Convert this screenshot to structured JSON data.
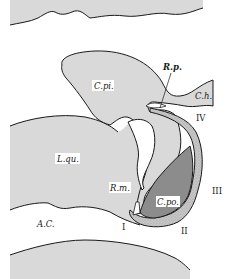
{
  "figure": {
    "colors": {
      "tissue": "#d9d9d9",
      "dark_region": "#8c8c8c",
      "outline": "#1a1a1a",
      "stipple_band": "#bdbdbd",
      "background": "#ffffff"
    },
    "labels": {
      "c_pi": "C.pi.",
      "r_p": "R.p.",
      "c_h": "C.h.",
      "iv": "IV",
      "l_qu": "L.qu.",
      "r_m": "R.m.",
      "c_po": "C.po.",
      "iii": "III",
      "a_c": "A.C.",
      "i": "I",
      "ii": "II"
    }
  }
}
